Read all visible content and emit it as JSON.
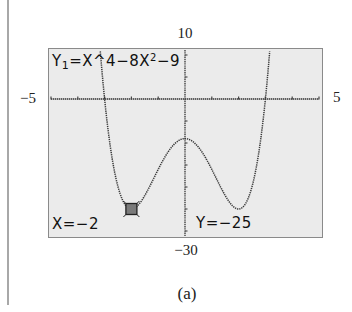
{
  "figure": {
    "caption": "(a)"
  },
  "window": {
    "xmin_label": "−5",
    "xmax_label": "5",
    "ymax_label": "10",
    "ymin_label": "−30"
  },
  "screen": {
    "equation_prefix": "Y",
    "equation_sub": "1",
    "equation_mid": "=X^4−8X",
    "equation_sup": "2",
    "equation_suffix": "−9",
    "cursor_x_text": "X=−2",
    "cursor_y_text": "Y=−25",
    "background_color": "#ebebeb",
    "cursor_color": "#7a7a7a"
  },
  "chart_data": {
    "type": "line",
    "xlabel": "",
    "ylabel": "",
    "xlim": [
      -5,
      5
    ],
    "ylim": [
      -30,
      10
    ],
    "grid": false,
    "x_ticks": [
      -5,
      -4,
      -3,
      -2,
      -1,
      0,
      1,
      2,
      3,
      4,
      5
    ],
    "y_ticks": [
      10,
      5,
      0,
      -5,
      -10,
      -15,
      -20,
      -25,
      -30
    ],
    "function": "x^4 - 8x^2 - 9",
    "series": [
      {
        "name": "Y1",
        "x": [
          -3.2,
          -3.0,
          -2.8,
          -2.6,
          -2.4,
          -2.2,
          -2.0,
          -1.8,
          -1.6,
          -1.4,
          -1.2,
          -1.0,
          -0.8,
          -0.6,
          -0.4,
          -0.2,
          0.0,
          0.2,
          0.4,
          0.6,
          0.8,
          1.0,
          1.2,
          1.4,
          1.6,
          1.8,
          2.0,
          2.2,
          2.4,
          2.6,
          2.8,
          3.0,
          3.2
        ],
        "y": [
          9.06,
          0.0,
          -8.25,
          -17.38,
          -21.91,
          -24.29,
          -25.0,
          -24.42,
          -22.93,
          -20.84,
          -18.45,
          -16.0,
          -13.71,
          -11.75,
          -10.26,
          -9.32,
          -9.0,
          -9.32,
          -10.26,
          -11.75,
          -13.71,
          -16.0,
          -18.45,
          -20.84,
          -22.93,
          -24.42,
          -25.0,
          -24.29,
          -21.91,
          -17.38,
          -8.25,
          0.0,
          9.06
        ]
      }
    ],
    "annotations": [
      {
        "type": "trace_cursor",
        "x": -2,
        "y": -25,
        "label": "X=-2  Y=-25"
      }
    ],
    "roots": [
      -3,
      3
    ],
    "local_max": {
      "x": 0,
      "y": -9
    },
    "local_mins": [
      {
        "x": -2,
        "y": -25
      },
      {
        "x": 2,
        "y": -25
      }
    ]
  }
}
